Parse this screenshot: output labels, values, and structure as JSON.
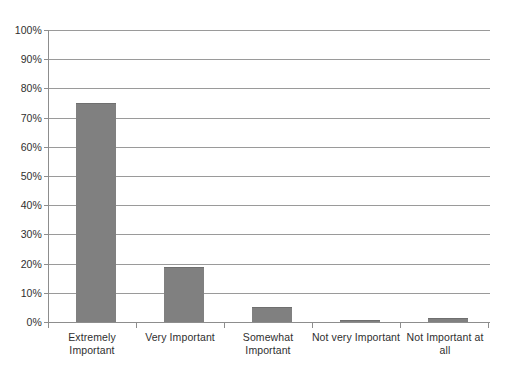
{
  "chart_data": {
    "type": "bar",
    "title": "",
    "subtitle": "",
    "xlabel": "",
    "ylabel": "",
    "categories": [
      "Extremely Important",
      "Very Important",
      "Somewhat Important",
      "Not very Important",
      "Not Important at all"
    ],
    "values": [
      75,
      19,
      5,
      0.5,
      1.5
    ],
    "ylim": [
      0,
      100
    ],
    "ytick_labels": [
      "0%",
      "10%",
      "20%",
      "30%",
      "40%",
      "50%",
      "60%",
      "70%",
      "80%",
      "90%",
      "100%"
    ],
    "ytick_values": [
      0,
      10,
      20,
      30,
      40,
      50,
      60,
      70,
      80,
      90,
      100
    ],
    "grid": true,
    "legend": "none",
    "value_format": "percent",
    "bar_color": "#808080",
    "bar_edge_color": "#6f6f6f",
    "axis_color": "#8d8d8d",
    "gridline_color": "#9a9a9a",
    "text_color": "#2f2f2f",
    "background_color": "#ffffff"
  }
}
